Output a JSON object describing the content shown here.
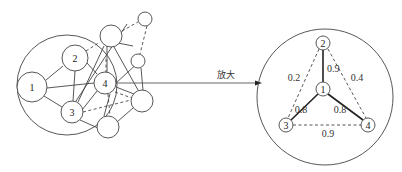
{
  "diagram": {
    "arrow_label": "放大",
    "left_graph": {
      "nodes": [
        {
          "id": "1",
          "label": "1"
        },
        {
          "id": "2",
          "label": "2"
        },
        {
          "id": "3",
          "label": "3"
        },
        {
          "id": "4",
          "label": "4"
        },
        {
          "id": "a",
          "label": ""
        },
        {
          "id": "b",
          "label": ""
        },
        {
          "id": "c",
          "label": ""
        },
        {
          "id": "d",
          "label": ""
        },
        {
          "id": "e",
          "label": ""
        }
      ]
    },
    "right_graph": {
      "nodes": [
        {
          "id": "1",
          "label": "1"
        },
        {
          "id": "2",
          "label": "2"
        },
        {
          "id": "3",
          "label": "3"
        },
        {
          "id": "4",
          "label": "4"
        }
      ],
      "edges": [
        {
          "from": "1",
          "to": "2",
          "weight": "0.9",
          "style": "solid"
        },
        {
          "from": "1",
          "to": "3",
          "weight": "0.8",
          "style": "solid"
        },
        {
          "from": "1",
          "to": "4",
          "weight": "0.8",
          "style": "solid"
        },
        {
          "from": "2",
          "to": "3",
          "weight": "0.2",
          "style": "dashed"
        },
        {
          "from": "2",
          "to": "4",
          "weight": "0.4",
          "style": "dashed"
        },
        {
          "from": "3",
          "to": "4",
          "weight": "0.9",
          "style": "dashed"
        }
      ]
    }
  }
}
